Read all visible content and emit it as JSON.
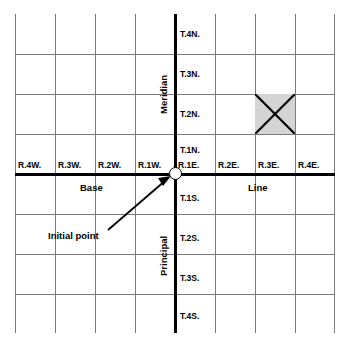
{
  "diagram": {
    "background_color": "#ffffff",
    "grid_line_color": "#7b7b7b",
    "axis_line_color": "#000000",
    "shaded_cell_color": "#d4d4d4",
    "columns": 8,
    "rows": 8
  },
  "axis_labels": {
    "meridian_word_top": "Meridian",
    "meridian_word_bottom": "Principal",
    "base_word_left": "Base",
    "base_word_right": "Line"
  },
  "range_labels": {
    "west": [
      "R.4W.",
      "R.3W.",
      "R.2W.",
      "R.1W."
    ],
    "east": [
      "R.1E.",
      "R.2E.",
      "R.3E.",
      "R.4E."
    ]
  },
  "township_labels": {
    "north": [
      "T.4N.",
      "T.3N.",
      "T.2N.",
      "T.1N."
    ],
    "south": [
      "T.1S.",
      "T.2S.",
      "T.3S.",
      "T.4S."
    ]
  },
  "annotations": {
    "initial_point_label": "Initial point",
    "initial_point_marker": "circle-marker"
  },
  "highlighted_section": {
    "range": "R.3E.",
    "township": "T.2N.",
    "marker": "x-cross",
    "fill": "#d4d4d4"
  }
}
